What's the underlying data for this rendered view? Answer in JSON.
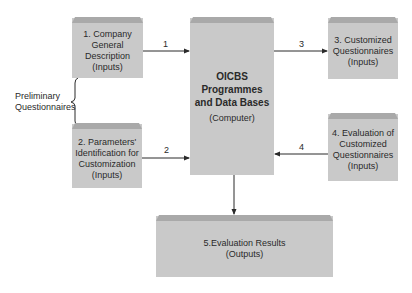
{
  "diagram": {
    "boxes": {
      "company_description": {
        "lines": [
          "1. Company",
          "General",
          "Description",
          "(Inputs)"
        ]
      },
      "parameters_identification": {
        "lines": [
          "2. Parameters'",
          "Identification for",
          "Customization",
          "(Inputs)"
        ]
      },
      "central": {
        "title_lines": [
          "OICBS",
          "Programmes",
          "and Data Bases"
        ],
        "subtitle": "(Computer)"
      },
      "customized_questionnaires": {
        "lines": [
          "3. Customized",
          "Questionnaires",
          "(Inputs)"
        ]
      },
      "evaluation_questionnaires": {
        "lines": [
          "4. Evaluation of",
          "Customized",
          "Questionnaires",
          "(Inputs)"
        ]
      },
      "evaluation_results": {
        "lines": [
          "5.Evaluation Results",
          "(Outputs)"
        ]
      }
    },
    "brace_label": {
      "lines": [
        "Preliminary",
        "Questionnaires"
      ]
    },
    "arrow_labels": {
      "a1": "1",
      "a2": "2",
      "a3": "3",
      "a4": "4"
    },
    "colors": {
      "box_fill": "#c9c9c9",
      "box_top": "#a9a9a9",
      "line": "#2a2a2a"
    }
  }
}
